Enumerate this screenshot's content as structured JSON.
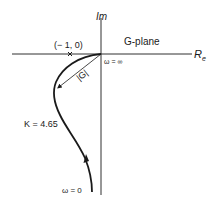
{
  "diagram": {
    "type": "nyquist-plot",
    "plane_label": "G-plane",
    "axes": {
      "imaginary": {
        "label": "Im"
      },
      "real": {
        "label": "R",
        "subscript": "e"
      }
    },
    "critical_point": {
      "label": "(− 1, 0)",
      "marker": "x"
    },
    "magnitude_label": "|G|",
    "gain_label": "K = 4.65",
    "frequency_labels": {
      "start": "ω = 0",
      "end": "ω = ∞"
    },
    "colors": {
      "ink": "#1a1a1a",
      "background": "#ffffff"
    }
  }
}
